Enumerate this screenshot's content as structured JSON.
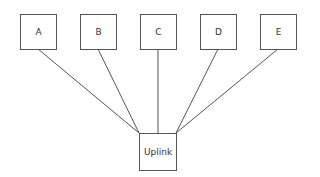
{
  "diagram": {
    "type": "star-topology",
    "nodes": [
      {
        "id": "A",
        "label": "A"
      },
      {
        "id": "B",
        "label": "B"
      },
      {
        "id": "C",
        "label": "C"
      },
      {
        "id": "D",
        "label": "D"
      },
      {
        "id": "E",
        "label": "E"
      }
    ],
    "hub": {
      "id": "Uplink",
      "label": "Uplink"
    },
    "edges": [
      [
        "A",
        "Uplink"
      ],
      [
        "B",
        "Uplink"
      ],
      [
        "C",
        "Uplink"
      ],
      [
        "D",
        "Uplink"
      ],
      [
        "E",
        "Uplink"
      ]
    ],
    "colors": {
      "stroke": "#555555",
      "text": "#333333",
      "background": "#ffffff"
    }
  }
}
